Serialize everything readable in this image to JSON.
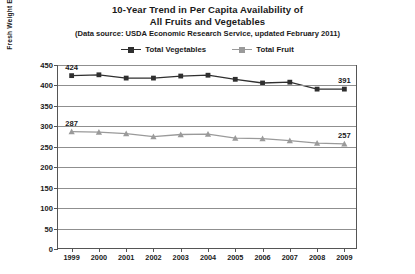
{
  "chart_data": {
    "type": "line",
    "title": "10-Year Trend in Per Capita Availability of All Fruits and Vegetables",
    "title_lines": [
      "10-Year Trend in Per Capita Availability of",
      "All Fruits and Vegetables"
    ],
    "subtitle": "(Data source: USDA Economic Research Service, updated February 2011)",
    "xlabel": "",
    "ylabel": "Fresh Weight Equivalents (in pounds)",
    "categories": [
      "1999",
      "2000",
      "2001",
      "2002",
      "2003",
      "2004",
      "2005",
      "2006",
      "2007",
      "2008",
      "2009"
    ],
    "ylim": [
      0,
      450
    ],
    "yticks": [
      450,
      400,
      350,
      300,
      250,
      200,
      150,
      100,
      50,
      0
    ],
    "grid": true,
    "legend_position": "top",
    "series": [
      {
        "name": "Total Vegetables",
        "color": "#2f2f2f",
        "marker": "square",
        "values": [
          424,
          426,
          418,
          418,
          423,
          425,
          415,
          406,
          408,
          391,
          391
        ],
        "point_labels": {
          "0": "424",
          "10": "391"
        }
      },
      {
        "name": "Total Fruit",
        "color": "#9a9a9a",
        "marker": "triangle",
        "values": [
          287,
          286,
          282,
          275,
          280,
          281,
          271,
          270,
          265,
          259,
          257
        ],
        "point_labels": {
          "0": "287",
          "10": "257"
        }
      }
    ],
    "annotations": [
      {
        "text": "424",
        "series": "Total Vegetables",
        "x": "1999"
      },
      {
        "text": "391",
        "series": "Total Vegetables",
        "x": "2009"
      },
      {
        "text": "287",
        "series": "Total Fruit",
        "x": "1999"
      },
      {
        "text": "257",
        "series": "Total Fruit",
        "x": "2009"
      }
    ]
  }
}
